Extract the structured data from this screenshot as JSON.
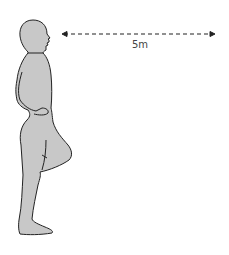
{
  "diagram": {
    "figure": {
      "pose": "single-leg stand, hands on hips",
      "fill_color": "#c8c8c8",
      "outline_color": "#222222"
    },
    "distance_marker": {
      "label": "5m",
      "style": "dashed double-headed arrow",
      "color": "#222222"
    }
  }
}
